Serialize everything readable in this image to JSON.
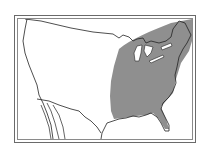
{
  "map": {
    "type": "range-map",
    "region": "United States and northern Mexico",
    "shaded_area": "Eastern United States",
    "colors": {
      "range_fill": "#8f8f8f",
      "land": "#ffffff",
      "border_lines": "#2a2a2a",
      "frame": "#6a6a6a"
    }
  }
}
